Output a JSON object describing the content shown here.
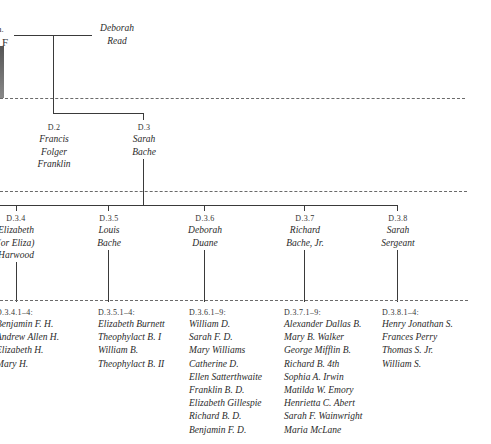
{
  "edge": {
    "fragment_top": "n.",
    "fragment_letter": "F"
  },
  "root": {
    "spouse": {
      "name_line1": "Deborah",
      "name_line2": "Read"
    }
  },
  "children": [
    {
      "code": "D.2",
      "name_lines": [
        "Francis",
        "Folger",
        "Franklin"
      ]
    },
    {
      "code": "D.3",
      "name_lines": [
        "Sarah",
        "Bache"
      ]
    }
  ],
  "grandchildren": [
    {
      "code": "D.3.4",
      "name_lines": [
        "Elizabeth",
        "(or Eliza)",
        "Harwood"
      ]
    },
    {
      "code": "D.3.5",
      "name_lines": [
        "Louis",
        "Bache"
      ]
    },
    {
      "code": "D.3.6",
      "name_lines": [
        "Deborah",
        "Duane"
      ]
    },
    {
      "code": "D.3.7",
      "name_lines": [
        "Richard",
        "Bache, Jr."
      ]
    },
    {
      "code": "D.3.8",
      "name_lines": [
        "Sarah",
        "Sergeant"
      ]
    }
  ],
  "great_grandchildren": [
    {
      "code": "D.3.4.1–4:",
      "names": [
        "Benjamin F. H.",
        "Andrew Allen H.",
        "Elizabeth H.",
        "Mary H."
      ]
    },
    {
      "code": "D.3.5.1–4:",
      "names": [
        "Elizabeth Burnett",
        "Theophylact B. I",
        "William B.",
        "Theophylact B. II"
      ]
    },
    {
      "code": "D.3.6.1–9:",
      "names": [
        "William D.",
        "Sarah F. D.",
        "Mary Williams",
        "Catherine D.",
        "Ellen Satterthwaite",
        "Franklin B. D.",
        "Elizabeth Gillespie",
        "Richard B. D.",
        "Benjamin F. D."
      ]
    },
    {
      "code": "D.3.7.1–9:",
      "names": [
        "Alexander Dallas B.",
        "Mary B. Walker",
        "George Mifflin B.",
        "Richard B. 4th",
        "Sophia A. Irwin",
        "Matilda W. Emory",
        "Henrietta C. Abert",
        "Sarah F. Wainwright",
        "Maria McLane"
      ]
    },
    {
      "code": "D.3.8.1–4:",
      "names": [
        "Henry Jonathan S.",
        "Frances Perry",
        "Thomas S. Jr.",
        "William S."
      ]
    }
  ]
}
